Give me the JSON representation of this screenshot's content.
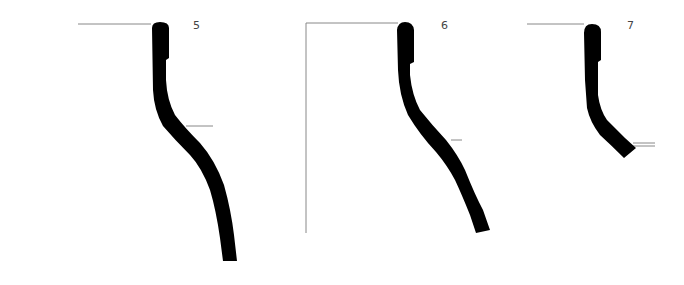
{
  "figure": {
    "type": "pottery-profile-drawings",
    "profiles": [
      {
        "id": "profile-5",
        "label": "5"
      },
      {
        "id": "profile-6",
        "label": "6"
      },
      {
        "id": "profile-7",
        "label": "7"
      }
    ],
    "colors": {
      "profile_fill": "#000000",
      "guide_line": "#888888",
      "background": "#ffffff"
    }
  }
}
